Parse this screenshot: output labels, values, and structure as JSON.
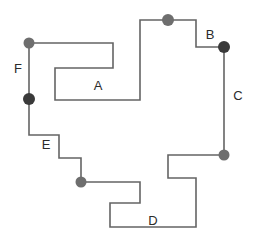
{
  "diagram": {
    "type": "rectilinear-polygon",
    "canvas": {
      "width": 254,
      "height": 247,
      "background": "#ffffff"
    },
    "style": {
      "stroke_color": "#646464",
      "stroke_width": 1.6,
      "dot_gray": "#6e6e6e",
      "dot_dark": "#3a3a3a",
      "label_color": "#2b2b2b",
      "label_font_size": 13
    },
    "boundary": {
      "closed": true,
      "points": [
        [
          29,
          43
        ],
        [
          113,
          43
        ],
        [
          113,
          68
        ],
        [
          55,
          68
        ],
        [
          55,
          100
        ],
        [
          140,
          100
        ],
        [
          140,
          20
        ],
        [
          196,
          20
        ],
        [
          196,
          47
        ],
        [
          224,
          47
        ],
        [
          224,
          155
        ],
        [
          168,
          155
        ],
        [
          168,
          178
        ],
        [
          196,
          178
        ],
        [
          196,
          227
        ],
        [
          110,
          227
        ],
        [
          110,
          203
        ],
        [
          140,
          203
        ],
        [
          140,
          182
        ],
        [
          81,
          182
        ],
        [
          81,
          158
        ],
        [
          59,
          158
        ],
        [
          59,
          135
        ],
        [
          29,
          135
        ]
      ]
    },
    "vertices": [
      {
        "id": "v1",
        "name": "vertex-top-left",
        "x": 29,
        "y": 43,
        "radius": 5.5,
        "color": "#6e6e6e"
      },
      {
        "id": "v2",
        "name": "vertex-left-lower",
        "x": 29,
        "y": 99,
        "radius": 6.0,
        "color": "#3a3a3a"
      },
      {
        "id": "v3",
        "name": "vertex-top-middle",
        "x": 168,
        "y": 20,
        "radius": 6.0,
        "color": "#6e6e6e"
      },
      {
        "id": "v4",
        "name": "vertex-right-upper",
        "x": 224,
        "y": 47,
        "radius": 6.0,
        "color": "#3a3a3a"
      },
      {
        "id": "v5",
        "name": "vertex-right-lower",
        "x": 224,
        "y": 155,
        "radius": 5.5,
        "color": "#6e6e6e"
      },
      {
        "id": "v6",
        "name": "vertex-bottom-left",
        "x": 81,
        "y": 182,
        "radius": 5.5,
        "color": "#6e6e6e"
      }
    ],
    "labels": [
      {
        "id": "lblA",
        "name": "segment-label-a",
        "text": "A",
        "x": 98,
        "y": 87
      },
      {
        "id": "lblB",
        "name": "segment-label-b",
        "text": "B",
        "x": 210,
        "y": 36
      },
      {
        "id": "lblC",
        "name": "segment-label-c",
        "text": "C",
        "x": 238,
        "y": 97
      },
      {
        "id": "lblD",
        "name": "segment-label-d",
        "text": "D",
        "x": 153,
        "y": 222
      },
      {
        "id": "lblE",
        "name": "segment-label-e",
        "text": "E",
        "x": 46,
        "y": 146
      },
      {
        "id": "lblF",
        "name": "segment-label-f",
        "text": "F",
        "x": 18,
        "y": 70
      }
    ]
  }
}
